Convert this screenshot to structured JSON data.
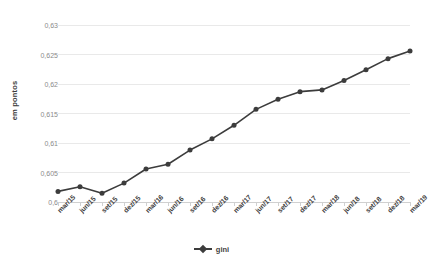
{
  "chart": {
    "ylabel": "em pontos",
    "legend_label": "gini",
    "series_color": "#3c3c3c",
    "grid_color": "#e9e9e9",
    "axis_color": "#d0d0d0"
  },
  "chart_data": {
    "type": "line",
    "title": "",
    "xlabel": "",
    "ylabel": "em pontos",
    "ylim": [
      0.6,
      0.63
    ],
    "yticks": [
      0.6,
      0.605,
      0.61,
      0.615,
      0.62,
      0.625,
      0.63
    ],
    "ytick_labels": [
      "0,6",
      "0,605",
      "0,61",
      "0,615",
      "0,62",
      "0,625",
      "0,63"
    ],
    "grid": true,
    "legend_position": "bottom",
    "categories": [
      "mar/15",
      "jun/15",
      "set/15",
      "dez/15",
      "mar/16",
      "jun/16",
      "set/16",
      "dez/16",
      "mar/17",
      "jun/17",
      "set/17",
      "dez/17",
      "mar/18",
      "jun/18",
      "set/18",
      "dez/18",
      "mar/19"
    ],
    "series": [
      {
        "name": "gini",
        "values": [
          0.6018,
          0.6026,
          0.6015,
          0.6032,
          0.6056,
          0.6064,
          0.6088,
          0.6107,
          0.613,
          0.6157,
          0.6174,
          0.6187,
          0.619,
          0.6206,
          0.6224,
          0.6243,
          0.6256
        ]
      }
    ]
  }
}
